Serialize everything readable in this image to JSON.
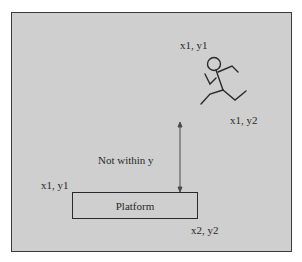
{
  "diagram": {
    "type": "collision-detection-illustration",
    "background_color": "#cfcfcf",
    "stroke_color": "#2a2a2a",
    "character": {
      "icon": "running-stick-figure-icon",
      "top_label": "x1, y1",
      "bottom_label": "x1, y2"
    },
    "platform": {
      "label": "Platform",
      "top_left_label": "x1, y1",
      "bottom_right_label": "x2, y2"
    },
    "gap_arrow": {
      "label": "Not within y",
      "direction": "vertical-double-headed"
    }
  }
}
